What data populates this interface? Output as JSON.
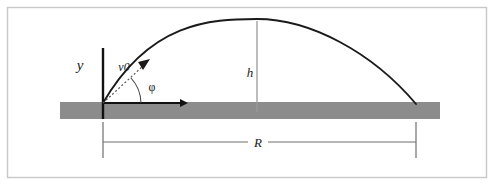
{
  "figure": {
    "kind": "projectile-motion-diagram",
    "title_text": "",
    "colors": {
      "background": "#ffffff",
      "frame_border": "#c8c8c8",
      "ground_bar": "#8c8c8c",
      "trajectory": "#1a1a1a",
      "axis": "#111111",
      "dimension_line": "#6e6e6e",
      "height_line": "#9a9a9a",
      "velocity_dotted": "#555555",
      "label_text": "#1a1a1a"
    },
    "labels": {
      "y_axis": "y",
      "initial_velocity": "v0",
      "launch_angle": "φ",
      "max_height": "h",
      "range": "R"
    },
    "geometry": {
      "origin_x": 103,
      "origin_y": 103,
      "apex_x": 257,
      "apex_y": 19,
      "landing_x": 416,
      "landing_y": 104,
      "ground_bar_left": 60,
      "ground_bar_right": 440,
      "ground_bar_top": 102,
      "ground_bar_bottom": 119,
      "y_axis_top": 48,
      "x_axis_arrow_end": 186,
      "velocity_arrow_tip_x": 148,
      "velocity_arrow_tip_y": 62,
      "range_dimension_y": 142,
      "range_tick_top": 120,
      "range_tick_bottom": 158,
      "frame_inset": 7
    }
  }
}
